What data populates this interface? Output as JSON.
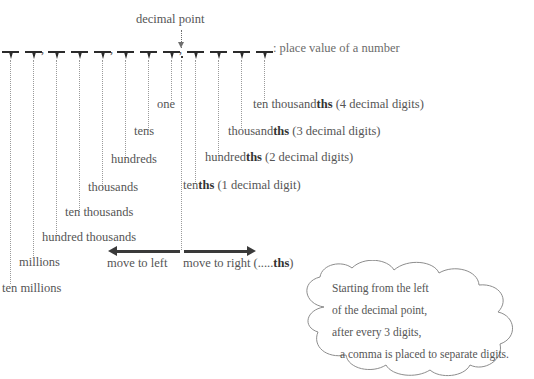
{
  "diagram": {
    "title_note": ": place value of a number",
    "decimal_point_label": "decimal point",
    "ruler": {
      "tick_count": 12,
      "comma_count": 3,
      "decimal_marker_color": "#3a3a3a",
      "tick_color": "#2b2b2b"
    },
    "integer_places": [
      {
        "label": "one"
      },
      {
        "label": "tens"
      },
      {
        "label": "hundreds"
      },
      {
        "label": "thousands"
      },
      {
        "label": "ten thousands"
      },
      {
        "label": "hundred thousands"
      },
      {
        "label": "millions"
      },
      {
        "label": "ten millions"
      }
    ],
    "decimal_places": [
      {
        "prefix": "ten thousand",
        "suffix": "ths",
        "detail": " (4 decimal digits)"
      },
      {
        "prefix": "thousand",
        "suffix": "ths",
        "detail": " (3 decimal digits)"
      },
      {
        "prefix": "hundred",
        "suffix": "ths",
        "detail": " (2 decimal digits)"
      },
      {
        "prefix": "ten",
        "suffix": "ths",
        "detail": " (1 decimal digit)"
      }
    ],
    "directions": {
      "left_label": "move to left",
      "right_label_prefix": "move to right (.....",
      "right_label_suffix": "ths",
      "right_label_end": ")"
    },
    "cloud": {
      "lines": [
        "Starting from the left",
        "of the decimal point,",
        "after every 3 digits,",
        "a comma is placed to separate digits."
      ]
    }
  }
}
